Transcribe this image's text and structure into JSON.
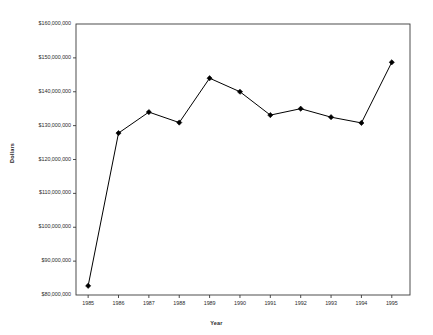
{
  "chart_data": {
    "type": "line",
    "title": "",
    "xlabel": "Year",
    "ylabel": "Dollars",
    "categories": [
      1985,
      1986,
      1987,
      1988,
      1989,
      1990,
      1991,
      1992,
      1993,
      1994,
      1995
    ],
    "x_tick_labels": [
      "1985",
      "1986",
      "1987",
      "1988",
      "1989",
      "1990",
      "1991",
      "1992",
      "1993",
      "1994",
      "1995"
    ],
    "values": [
      82700000,
      127800000,
      134000000,
      130900000,
      144000000,
      140000000,
      133100000,
      135000000,
      132500000,
      130800000,
      148700000
    ],
    "y_tick_labels": [
      "$160,000,000",
      "$150,000,000",
      "$140,000,000",
      "$130,000,000",
      "$120,000,000",
      "$110,000,000",
      "$100,000,000",
      "$90,000,000",
      "$80,000,000"
    ],
    "y_tick_values": [
      160000000,
      150000000,
      140000000,
      130000000,
      120000000,
      110000000,
      100000000,
      90000000,
      80000000
    ],
    "ylim": [
      80000000,
      160000000
    ],
    "xlim": [
      1984.6,
      1995.6
    ],
    "grid": false,
    "legend": null,
    "legend_position": "none",
    "series": [
      {
        "name": "Dollars",
        "marker": "diamond",
        "line_color": "#000000",
        "marker_color": "#000000",
        "values": [
          82700000,
          127800000,
          134000000,
          130900000,
          144000000,
          140000000,
          133100000,
          135000000,
          132500000,
          130800000,
          148700000
        ]
      }
    ],
    "colors": {
      "line": "#000000",
      "marker": "#000000",
      "axis": "#3a3a3a",
      "text": "#2b2b2b",
      "background": "#ffffff"
    },
    "plot_area": {
      "left": 76,
      "right": 410,
      "top": 24,
      "bottom": 295
    }
  }
}
